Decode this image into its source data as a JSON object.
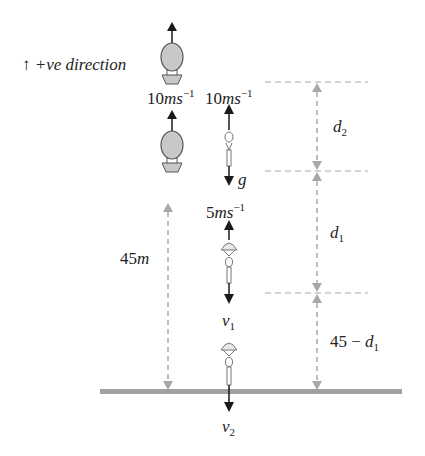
{
  "diagram": {
    "type": "physics-free-fall-diagram",
    "direction_label": {
      "arrow": "↑",
      "text": "+ve direction"
    },
    "balloon": {
      "positions": [
        "top",
        "lower"
      ],
      "velocity_label": {
        "value": "10",
        "unit": "ms",
        "exp": "−1"
      }
    },
    "parachutist": {
      "initial_velocity": {
        "value": "10",
        "unit": "ms",
        "exp": "−1"
      },
      "gravity_label": "g",
      "velocity_mid": {
        "value": "5",
        "unit": "ms",
        "exp": "−1"
      },
      "velocity_v1": {
        "symbol": "v",
        "sub": "1"
      },
      "velocity_v2": {
        "symbol": "v",
        "sub": "2"
      }
    },
    "height_label": {
      "value": "45",
      "unit": "m"
    },
    "distances": [
      {
        "name": "d2",
        "symbol": "d",
        "sub": "2"
      },
      {
        "name": "d1",
        "symbol": "d",
        "sub": "1"
      },
      {
        "name": "45-d1",
        "prefix": "45 − ",
        "symbol": "d",
        "sub": "1"
      }
    ],
    "colors": {
      "balloon_fill": "#c8c8c8",
      "outline": "#555555",
      "dashed": "#a8a8a8",
      "ground": "#a0a0a0",
      "arrow": "#1a1a1a"
    }
  }
}
